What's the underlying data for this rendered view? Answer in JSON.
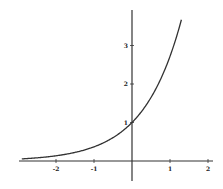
{
  "chart_data": {
    "type": "line",
    "title": "",
    "xlabel": "",
    "ylabel": "",
    "function": "y = e^x",
    "xlim": [
      -3.0,
      2.1
    ],
    "ylim": [
      -0.5,
      3.9
    ],
    "grid": false,
    "legend": null,
    "x_ticks": [
      -2,
      -1,
      1,
      2
    ],
    "x_tick_labels": [
      "-2",
      "-1",
      "1",
      "2"
    ],
    "y_ticks": [
      1,
      2,
      3
    ],
    "y_tick_labels": [
      "1",
      "2",
      "3"
    ],
    "series": [
      {
        "name": "exp(x)",
        "x": [
          -2.9,
          -2.5,
          -2.0,
          -1.5,
          -1.0,
          -0.5,
          0.0,
          0.25,
          0.5,
          0.75,
          1.0,
          1.1,
          1.2,
          1.3
        ],
        "y": [
          0.055,
          0.082,
          0.135,
          0.223,
          0.368,
          0.607,
          1.0,
          1.284,
          1.649,
          2.117,
          2.718,
          3.004,
          3.32,
          3.669
        ]
      }
    ],
    "colors": {
      "curve": "#333333",
      "axes": "#333333",
      "background": "#ffffff"
    }
  }
}
